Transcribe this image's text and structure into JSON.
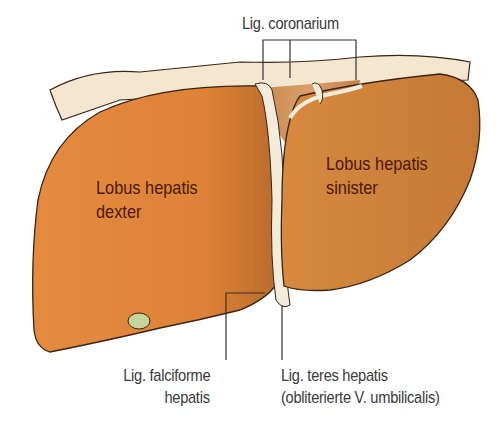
{
  "diagram": {
    "colors": {
      "liver": "#d9823a",
      "liver_light": "#e8914a",
      "liver_dark": "#b8672a",
      "peritoneum": "#f5e6cf",
      "ligament": "#f3ecdd",
      "gallbladder": "#c5d49a",
      "outline": "#3a2414",
      "leader": "#333333",
      "label_text": "#3a3a3a",
      "organ_text": "#4a1a0a"
    },
    "labels": {
      "lig_coronarium": "Lig. coronarium",
      "lobus_dexter_line1": "Lobus hepatis",
      "lobus_dexter_line2": "dexter",
      "lobus_sinister_line1": "Lobus hepatis",
      "lobus_sinister_line2": "sinister",
      "lig_falciforme_line1": "Lig. falciforme",
      "lig_falciforme_line2": "hepatis",
      "lig_teres_line1": "Lig. teres hepatis",
      "lig_teres_line2": "(obliterierte V. umbilicalis)"
    }
  }
}
